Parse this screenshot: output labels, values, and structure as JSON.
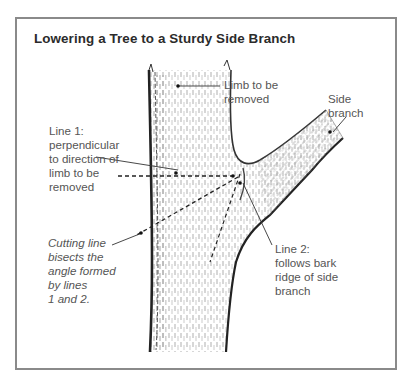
{
  "diagram": {
    "title": "Lowering a Tree to a Sturdy Side Branch",
    "labels": {
      "limb": "Limb to be\nremoved",
      "side_branch": "Side\nbranch",
      "line1": "Line 1:\nperpendicular\nto direction of\nlimb to be\nremoved",
      "cutting_line": "Cutting line\nbisects the\nangle formed\nby lines\n1 and 2.",
      "line2": "Line 2:\nfollows bark\nridge of side\nbranch"
    },
    "colors": {
      "frame": "#8a8a8a",
      "ink": "#333333",
      "label_text": "#555555"
    }
  }
}
